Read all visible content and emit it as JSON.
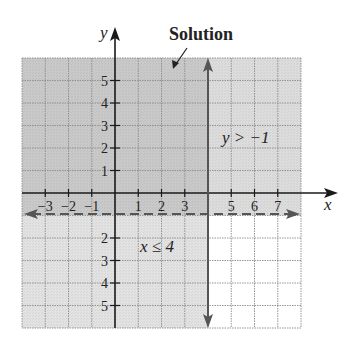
{
  "chart_data": {
    "type": "region",
    "title": "Solution",
    "xlabel": "x",
    "ylabel": "y",
    "xlim": [
      -4,
      8
    ],
    "ylim": [
      -6,
      6
    ],
    "grid": true,
    "x_ticks": [
      -3,
      -2,
      -1,
      1,
      2,
      3,
      5,
      6,
      7
    ],
    "y_ticks": [
      5,
      4,
      3,
      2,
      1,
      -2,
      -3,
      -4,
      -5
    ],
    "x_tick_labels": [
      "−3",
      "−2",
      "−1",
      "1",
      "2",
      "3",
      "5",
      "6",
      "7"
    ],
    "y_tick_labels": [
      "5",
      "4",
      "3",
      "2",
      "1",
      "2",
      "3",
      "4",
      "5"
    ],
    "boundaries": [
      {
        "equation": "x = 4",
        "style": "solid",
        "label": "x ≤ 4",
        "shade": "left"
      },
      {
        "equation": "y = -1",
        "style": "dashed",
        "label": "y > −1",
        "shade": "above"
      }
    ],
    "regions": [
      {
        "name": "solution",
        "x": [
          -4,
          4
        ],
        "y": [
          -1,
          6
        ],
        "color": "#c9c9c9"
      },
      {
        "name": "y-only",
        "x": [
          4,
          8
        ],
        "y": [
          -1,
          6
        ],
        "color": "#dcdcdc"
      },
      {
        "name": "x-only",
        "x": [
          -4,
          4
        ],
        "y": [
          -6,
          -1
        ],
        "color": "#e2e2e2"
      },
      {
        "name": "neither",
        "x": [
          4,
          8
        ],
        "y": [
          -6,
          -1
        ],
        "color": "#ffffff"
      }
    ],
    "annotations": [
      {
        "text": "Solution",
        "points_to": [
          2.5,
          5.2
        ]
      },
      {
        "text": "y > −1",
        "at": [
          4.6,
          2.3
        ]
      },
      {
        "text": "x ≤ 4",
        "at": [
          1.1,
          -2.4
        ]
      }
    ]
  },
  "labels": {
    "title": "Solution",
    "x_axis": "x",
    "y_axis": "y",
    "ineq_y": "y > −1",
    "ineq_x": "x ≤ 4"
  },
  "colors": {
    "solution": "#c9c9c9",
    "half_y": "#dcdcdc",
    "half_x": "#e2e2e2",
    "grid": "#8a8a8a",
    "axis": "#1a1a1a",
    "boundary": "#555555"
  }
}
